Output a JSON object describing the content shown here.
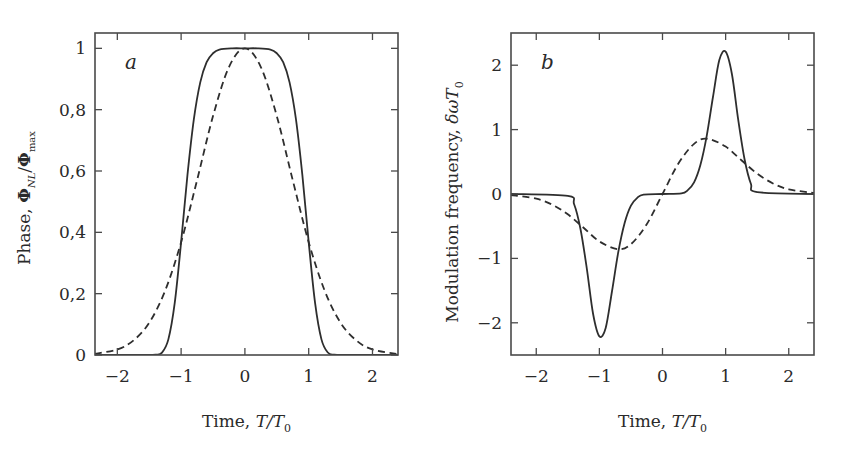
{
  "chart_data": [
    {
      "type": "line",
      "panel_label": "a",
      "title": "",
      "xlabel": "Time,  T/T₀",
      "xlabel_parts": {
        "prefix": "Time,  ",
        "var": "T/T",
        "sub": "0"
      },
      "ylabel": "Phase,  Φ_NL/Φ_max",
      "ylabel_parts": {
        "prefix": "Phase,  ",
        "phi1": "Φ",
        "sub1": "NL",
        "slash": "/",
        "phi2": "Φ",
        "sub2": "max"
      },
      "xlim": [
        -2.35,
        2.4
      ],
      "ylim": [
        0,
        1.05
      ],
      "xticks": [
        -2,
        -1,
        0,
        1,
        2
      ],
      "xtick_labels": [
        "−2",
        "−1",
        "0",
        "1",
        "2"
      ],
      "yticks": [
        0,
        0.2,
        0.4,
        0.6,
        0.8,
        1
      ],
      "ytick_labels": [
        "0",
        "0,2",
        "0,4",
        "0,6",
        "0,8",
        "1"
      ],
      "grid": false,
      "legend": "none",
      "series": [
        {
          "name": "super-Gaussian (m=3), solid",
          "style": "solid",
          "x": [
            -2.35,
            -1.6,
            -1.4,
            -1.3,
            -1.2,
            -1.1,
            -1.0,
            -0.9,
            -0.8,
            -0.7,
            -0.6,
            -0.5,
            -0.4,
            -0.2,
            0,
            0.2,
            0.4,
            0.5,
            0.6,
            0.7,
            0.8,
            0.9,
            1.0,
            1.1,
            1.2,
            1.3,
            1.4,
            1.6,
            2.4
          ],
          "y": [
            0,
            0,
            0.001,
            0.008,
            0.051,
            0.17,
            0.368,
            0.588,
            0.769,
            0.889,
            0.955,
            0.984,
            0.996,
            1.0,
            1.0,
            1.0,
            0.996,
            0.984,
            0.955,
            0.889,
            0.769,
            0.588,
            0.368,
            0.17,
            0.051,
            0.008,
            0.001,
            0,
            0
          ]
        },
        {
          "name": "Gaussian (m=1), dashed",
          "style": "dashed",
          "x": [
            -2.35,
            -2.0,
            -1.75,
            -1.5,
            -1.25,
            -1.0,
            -0.75,
            -0.5,
            -0.25,
            0,
            0.25,
            0.5,
            0.75,
            1.0,
            1.25,
            1.5,
            1.75,
            2.0,
            2.4
          ],
          "y": [
            0.004,
            0.018,
            0.047,
            0.105,
            0.21,
            0.368,
            0.57,
            0.779,
            0.939,
            1.0,
            0.939,
            0.779,
            0.57,
            0.368,
            0.21,
            0.105,
            0.047,
            0.018,
            0.003
          ]
        }
      ]
    },
    {
      "type": "line",
      "panel_label": "b",
      "title": "",
      "xlabel": "Time,  T/T₀",
      "xlabel_parts": {
        "prefix": "Time,  ",
        "var": "T/T",
        "sub": "0"
      },
      "ylabel": "Modulation frequency,  δωT₀",
      "ylabel_parts": {
        "prefix": "Modulation frequency,  ",
        "var": "δωT",
        "sub": "0"
      },
      "xlim": [
        -2.4,
        2.4
      ],
      "ylim": [
        -2.5,
        2.5
      ],
      "xticks": [
        -2,
        -1,
        0,
        1,
        2
      ],
      "xtick_labels": [
        "−2",
        "−1",
        "0",
        "1",
        "2"
      ],
      "yticks": [
        -2,
        -1,
        0,
        1,
        2
      ],
      "ytick_labels": [
        "−2",
        "−1",
        "0",
        "1",
        "2"
      ],
      "grid": false,
      "legend": "none",
      "series": [
        {
          "name": "super-Gaussian (m=3), solid",
          "style": "solid",
          "x": [
            -2.4,
            -1.5,
            -1.4,
            -1.3,
            -1.2,
            -1.1,
            -1.0,
            -0.9,
            -0.8,
            -0.7,
            -0.6,
            -0.5,
            -0.4,
            -0.3,
            0,
            0.3,
            0.4,
            0.5,
            0.6,
            0.7,
            0.8,
            0.9,
            1.0,
            1.1,
            1.2,
            1.3,
            1.4,
            1.5,
            2.4
          ],
          "y": [
            0,
            -0.03,
            -0.16,
            -0.54,
            -1.15,
            -1.86,
            -2.21,
            -2.08,
            -1.51,
            -0.9,
            -0.45,
            -0.18,
            -0.06,
            -0.01,
            0,
            0.01,
            0.06,
            0.18,
            0.45,
            0.9,
            1.51,
            2.08,
            2.21,
            1.86,
            1.15,
            0.54,
            0.16,
            0.03,
            0
          ]
        },
        {
          "name": "Gaussian (m=1), dashed",
          "style": "dashed",
          "x": [
            -2.4,
            -2.0,
            -1.75,
            -1.5,
            -1.25,
            -1.0,
            -0.707,
            -0.5,
            -0.25,
            0,
            0.25,
            0.5,
            0.707,
            1.0,
            1.25,
            1.5,
            1.75,
            2.0,
            2.4
          ],
          "y": [
            -0.015,
            -0.073,
            -0.164,
            -0.316,
            -0.524,
            -0.736,
            -0.858,
            -0.779,
            -0.47,
            0,
            0.47,
            0.779,
            0.858,
            0.736,
            0.524,
            0.316,
            0.164,
            0.073,
            0.015
          ]
        }
      ]
    }
  ],
  "layout": {
    "panels": [
      {
        "left": 95,
        "top": 33,
        "right": 398,
        "bottom": 355
      },
      {
        "left": 511,
        "top": 33,
        "right": 814,
        "bottom": 355
      }
    ]
  }
}
